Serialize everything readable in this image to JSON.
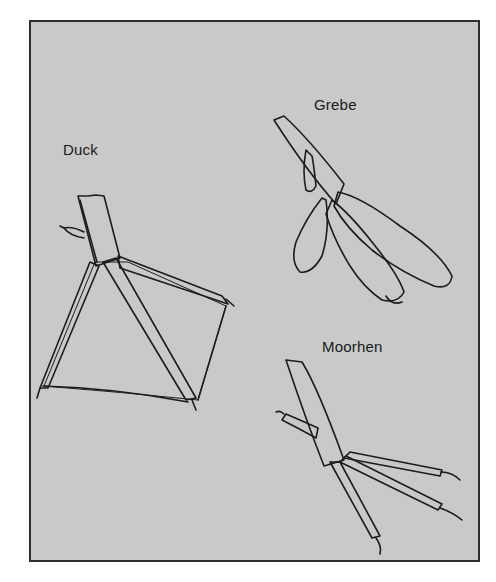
{
  "figure": {
    "background": "#c9c9c9",
    "border_color": "#2e2e2e",
    "ink_color": "#1c1c1c",
    "labels": {
      "duck": "Duck",
      "grebe": "Grebe",
      "moorhen": "Moorhen"
    },
    "panels": [
      {
        "name": "Duck",
        "foot_type": "webbed"
      },
      {
        "name": "Grebe",
        "foot_type": "lobed"
      },
      {
        "name": "Moorhen",
        "foot_type": "unwebbed"
      }
    ]
  }
}
